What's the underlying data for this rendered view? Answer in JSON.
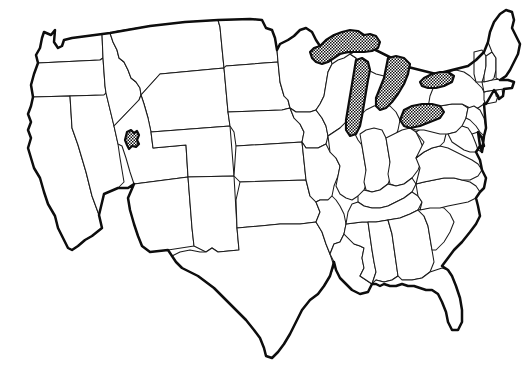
{
  "figure": {
    "kind": "map",
    "projection_style": "conic",
    "region": "Contiguous United States (lower 48)",
    "background_color": "#ffffff",
    "outline_color": "#1a1a1a",
    "national_border_color": "#0d0d0d",
    "water_fill_pattern": "stippled-crosshatch",
    "water_fill_color": "#111111",
    "has_labels": false,
    "has_legend": false,
    "has_title_text": false,
    "line_style": "solid"
  },
  "layers": [
    {
      "name": "national-outline",
      "label": "National outline",
      "stroke_width": 2.5,
      "visible": true
    },
    {
      "name": "state-boundaries",
      "label": "State boundaries",
      "stroke_width": 1.05,
      "visible": true
    },
    {
      "name": "water-bodies",
      "label": "Water bodies",
      "fill": "stipple",
      "visible": true
    }
  ],
  "water_bodies": [
    {
      "name": "lake-superior",
      "label": "Lake Superior"
    },
    {
      "name": "lake-michigan",
      "label": "Lake Michigan"
    },
    {
      "name": "lake-huron",
      "label": "Lake Huron"
    },
    {
      "name": "lake-erie",
      "label": "Lake Erie"
    },
    {
      "name": "lake-ontario",
      "label": "Lake Ontario"
    },
    {
      "name": "great-salt-lake",
      "label": "Great Salt Lake"
    }
  ],
  "states": [
    {
      "code": "WA",
      "label": "Washington"
    },
    {
      "code": "OR",
      "label": "Oregon"
    },
    {
      "code": "CA",
      "label": "California"
    },
    {
      "code": "NV",
      "label": "Nevada"
    },
    {
      "code": "ID",
      "label": "Idaho"
    },
    {
      "code": "MT",
      "label": "Montana"
    },
    {
      "code": "WY",
      "label": "Wyoming"
    },
    {
      "code": "UT",
      "label": "Utah"
    },
    {
      "code": "AZ",
      "label": "Arizona"
    },
    {
      "code": "CO",
      "label": "Colorado"
    },
    {
      "code": "NM",
      "label": "New Mexico"
    },
    {
      "code": "ND",
      "label": "North Dakota"
    },
    {
      "code": "SD",
      "label": "South Dakota"
    },
    {
      "code": "NE",
      "label": "Nebraska"
    },
    {
      "code": "KS",
      "label": "Kansas"
    },
    {
      "code": "OK",
      "label": "Oklahoma"
    },
    {
      "code": "TX",
      "label": "Texas"
    },
    {
      "code": "MN",
      "label": "Minnesota"
    },
    {
      "code": "IA",
      "label": "Iowa"
    },
    {
      "code": "MO",
      "label": "Missouri"
    },
    {
      "code": "AR",
      "label": "Arkansas"
    },
    {
      "code": "LA",
      "label": "Louisiana"
    },
    {
      "code": "WI",
      "label": "Wisconsin"
    },
    {
      "code": "IL",
      "label": "Illinois"
    },
    {
      "code": "MS",
      "label": "Mississippi"
    },
    {
      "code": "MI",
      "label": "Michigan"
    },
    {
      "code": "IN",
      "label": "Indiana"
    },
    {
      "code": "OH",
      "label": "Ohio"
    },
    {
      "code": "KY",
      "label": "Kentucky"
    },
    {
      "code": "TN",
      "label": "Tennessee"
    },
    {
      "code": "AL",
      "label": "Alabama"
    },
    {
      "code": "GA",
      "label": "Georgia"
    },
    {
      "code": "FL",
      "label": "Florida"
    },
    {
      "code": "SC",
      "label": "South Carolina"
    },
    {
      "code": "NC",
      "label": "North Carolina"
    },
    {
      "code": "VA",
      "label": "Virginia"
    },
    {
      "code": "WV",
      "label": "West Virginia"
    },
    {
      "code": "PA",
      "label": "Pennsylvania"
    },
    {
      "code": "NY",
      "label": "New York"
    },
    {
      "code": "MD",
      "label": "Maryland"
    },
    {
      "code": "DE",
      "label": "Delaware"
    },
    {
      "code": "NJ",
      "label": "New Jersey"
    },
    {
      "code": "CT",
      "label": "Connecticut"
    },
    {
      "code": "RI",
      "label": "Rhode Island"
    },
    {
      "code": "MA",
      "label": "Massachusetts"
    },
    {
      "code": "VT",
      "label": "Vermont"
    },
    {
      "code": "NH",
      "label": "New Hampshire"
    },
    {
      "code": "ME",
      "label": "Maine"
    }
  ]
}
